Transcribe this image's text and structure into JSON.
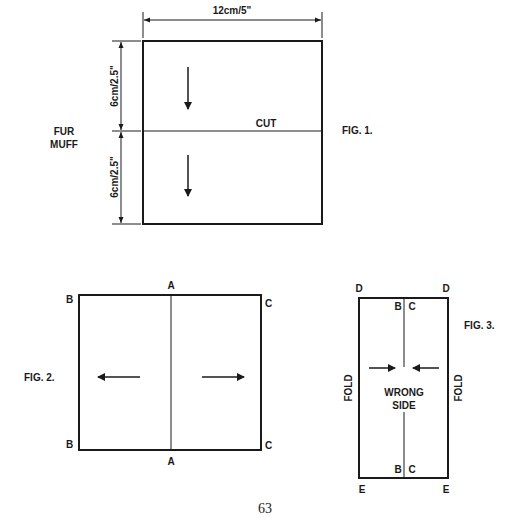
{
  "fig1": {
    "caption": "FIG. 1.",
    "title_line1": "FUR",
    "title_line2": "MUFF",
    "width_dim": "12cm/5\"",
    "height_dim_top": "6cm/2.5\"",
    "height_dim_bottom": "6cm/2.5\"",
    "cut_label": "CUT"
  },
  "fig2": {
    "caption": "FIG. 2.",
    "top_center": "A",
    "bottom_center": "A",
    "top_left": "B",
    "bottom_left": "B",
    "top_right": "C",
    "bottom_right": "C"
  },
  "fig3": {
    "caption": "FIG. 3.",
    "top_left": "D",
    "top_right": "D",
    "bottom_left": "E",
    "bottom_right": "E",
    "inner_top_left": "B",
    "inner_top_right": "C",
    "inner_bottom_left": "B",
    "inner_bottom_right": "C",
    "fold_left": "FOLD",
    "fold_right": "FOLD",
    "center_line1": "WRONG",
    "center_line2": "SIDE"
  },
  "page_number": "63"
}
